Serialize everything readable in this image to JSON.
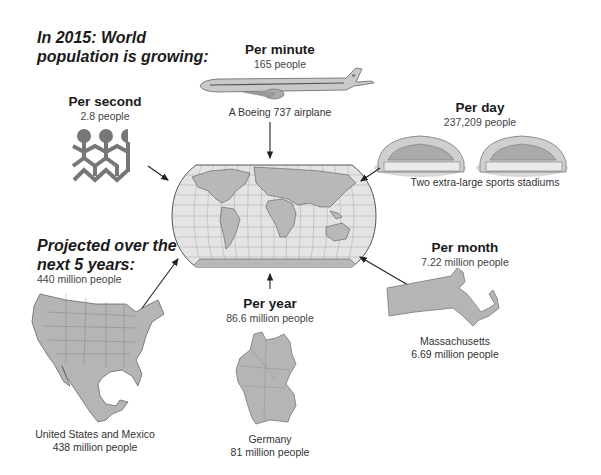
{
  "title": {
    "line1": "In 2015: World",
    "line2": "population is growing:"
  },
  "projection": {
    "line1": "Projected over the",
    "line2": "next 5 years:",
    "value": "440 million people",
    "comparison_name": "United States and Mexico",
    "comparison_value": "438 million people",
    "icon": "us-mexico-map-icon"
  },
  "rates": [
    {
      "heading": "Per second",
      "value": "2.8 people",
      "comparison_name": "",
      "comparison_value": "",
      "icon": "paper-dolls-icon"
    },
    {
      "heading": "Per minute",
      "value": "165 people",
      "comparison_name": "A Boeing 737 airplane",
      "comparison_value": "",
      "icon": "airplane-icon"
    },
    {
      "heading": "Per day",
      "value": "237,209 people",
      "comparison_name": "Two extra-large sports stadiums",
      "comparison_value": "",
      "icon": "stadium-icon"
    },
    {
      "heading": "Per month",
      "value": "7.22 million people",
      "comparison_name": "Massachusetts",
      "comparison_value": "6.69 million people",
      "icon": "massachusetts-map-icon"
    },
    {
      "heading": "Per year",
      "value": "86.6 million people",
      "comparison_name": "Germany",
      "comparison_value": "81 million people",
      "icon": "germany-map-icon"
    }
  ],
  "center": {
    "icon": "world-map-icon"
  },
  "colors": {
    "map_fill": "#b5b5b5",
    "ocean": "#e2e2e2",
    "line": "#555555",
    "text": "#1a1a1a"
  }
}
